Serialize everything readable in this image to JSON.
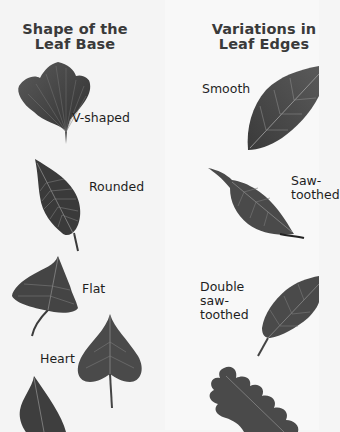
{
  "left_panel": {
    "heading_line1": "Shape of the",
    "heading_line2": "Leaf Base",
    "items": [
      {
        "label": "V-shaped",
        "leaf": "ginkgo-leaf"
      },
      {
        "label": "Rounded",
        "leaf": "rounded-base-leaf"
      },
      {
        "label": "Flat",
        "leaf": "flat-base-leaf"
      },
      {
        "label": "Heart",
        "leaf": "heart-base-leaf"
      }
    ]
  },
  "right_panel": {
    "heading_line1": "Variations in",
    "heading_line2": "Leaf Edges",
    "items": [
      {
        "label": "Smooth",
        "leaf": "smooth-edge-leaf"
      },
      {
        "label_line1": "Saw-",
        "label_line2": "toothed",
        "leaf": "saw-toothed-leaf"
      },
      {
        "label_line1": "Double",
        "label_line2": "saw-",
        "label_line3": "toothed",
        "leaf": "double-saw-toothed-leaf"
      },
      {
        "label": "",
        "leaf": "lobed-oak-leaf"
      }
    ]
  }
}
